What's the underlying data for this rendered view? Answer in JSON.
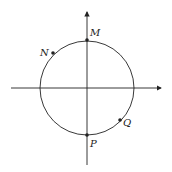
{
  "diagram": {
    "type": "unit-circle-on-axes",
    "points": [
      {
        "label": "M",
        "x": 87,
        "y": 40,
        "lx": 90,
        "ly": 36
      },
      {
        "label": "N",
        "x": 53,
        "y": 53,
        "lx": 40,
        "ly": 55
      },
      {
        "label": "P",
        "x": 87,
        "y": 135,
        "lx": 89,
        "ly": 147
      },
      {
        "label": "Q",
        "x": 120,
        "y": 120,
        "lx": 124,
        "ly": 125
      }
    ],
    "colors": {
      "stroke": "#222222",
      "background": "#ffffff"
    }
  }
}
